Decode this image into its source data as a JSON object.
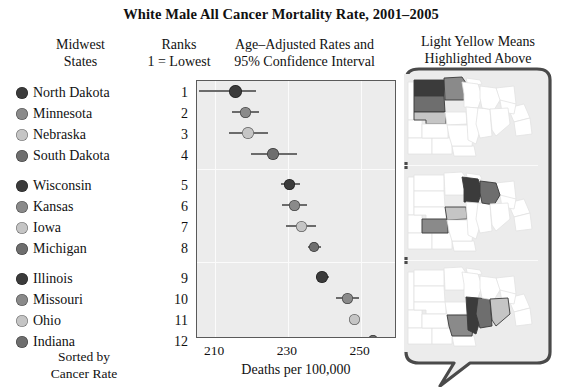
{
  "title": "White Male All Cancer Mortality Rate, 2001–2005",
  "headers": {
    "states_line1": "Midwest",
    "states_line2": "States",
    "ranks_line1": "Ranks",
    "ranks_line2": "1 = Lowest",
    "rates_line1": "Age–Adjusted Rates and",
    "rates_line2": "95% Confidence Interval",
    "maps_line1": "Light Yellow Means",
    "maps_line2": "Highlighted Above"
  },
  "footer": {
    "sorted_line1": "Sorted by",
    "sorted_line2": "Cancer Rate"
  },
  "axis": {
    "xlabel": "Deaths per 100,000",
    "ticks": [
      "210",
      "230",
      "250"
    ],
    "tick_values": [
      210,
      230,
      250
    ],
    "xlim": [
      205,
      260
    ]
  },
  "palette": {
    "shade_dark": "#3b3b3b",
    "shade_medium": "#8a8a8a",
    "shade_light": "#c5c5c5",
    "shade_mid_dark": "#6e6e6e",
    "plot_background": "#ececec",
    "gridline": "#fbfbfb",
    "interval_line": "#6b6b6b",
    "panel_border": "#5a5a5a",
    "callout_outline": "#4a4a4a"
  },
  "chart_data": {
    "type": "scatter",
    "title": "White Male All Cancer Mortality Rate, 2001–2005",
    "xlabel": "Deaths per 100,000",
    "ylabel": "",
    "xlim": [
      205,
      260
    ],
    "grid": true,
    "legend": "none",
    "categories": [
      "North Dakota",
      "Minnesota",
      "Nebraska",
      "South Dakota",
      "Wisconsin",
      "Kansas",
      "Iowa",
      "Michigan",
      "Illinois",
      "Missouri",
      "Ohio",
      "Indiana"
    ],
    "ranks": [
      1,
      2,
      3,
      4,
      5,
      6,
      7,
      8,
      9,
      10,
      11,
      12
    ],
    "values": [
      215.5,
      218.3,
      219.1,
      226.0,
      230.5,
      231.8,
      233.6,
      237.2,
      239.5,
      246.3,
      248.2,
      253.4
    ],
    "ci_low": [
      205.5,
      214.5,
      213.8,
      219.8,
      228.0,
      228.3,
      229.5,
      235.5,
      237.8,
      243.3,
      247.2,
      250.6
    ],
    "ci_high": [
      221.2,
      222.0,
      224.5,
      232.5,
      233.2,
      235.3,
      237.6,
      239.0,
      241.2,
      249.5,
      249.2,
      255.8
    ],
    "point_shades": [
      "#3b3b3b",
      "#8a8a8a",
      "#c5c5c5",
      "#6e6e6e",
      "#3b3b3b",
      "#8a8a8a",
      "#c5c5c5",
      "#6e6e6e",
      "#3b3b3b",
      "#8a8a8a",
      "#c5c5c5",
      "#6e6e6e"
    ],
    "point_sizes": [
      13,
      11,
      12,
      12,
      11,
      11,
      11,
      10,
      12,
      11,
      11,
      10
    ],
    "groups": [
      {
        "label": "group-1",
        "ranks": [
          1,
          2,
          3,
          4
        ]
      },
      {
        "label": "group-2",
        "ranks": [
          5,
          6,
          7,
          8
        ]
      },
      {
        "label": "group-3",
        "ranks": [
          9,
          10,
          11,
          12
        ]
      }
    ]
  },
  "maps": [
    {
      "name": "map-panel-group-1",
      "highlighted": [
        "North Dakota",
        "Minnesota",
        "Nebraska",
        "South Dakota"
      ]
    },
    {
      "name": "map-panel-group-2",
      "highlighted": [
        "Wisconsin",
        "Kansas",
        "Iowa",
        "Michigan"
      ]
    },
    {
      "name": "map-panel-group-3",
      "highlighted": [
        "Illinois",
        "Missouri",
        "Ohio",
        "Indiana"
      ]
    }
  ]
}
